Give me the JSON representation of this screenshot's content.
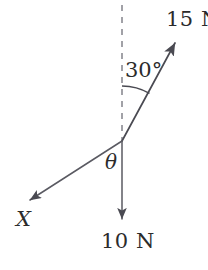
{
  "figure": {
    "type": "force-vector-diagram",
    "background_color": "#ffffff",
    "stroke_color": "#4a4a52",
    "text_color": "#2b2b2b"
  },
  "labels": {
    "force_up_right": "15 N",
    "angle_from_vertical": "30°",
    "angle_unknown": "θ",
    "force_down_left": "X",
    "force_down": "10 N"
  },
  "vectors": [
    {
      "name": "15N-vector",
      "label": "15 N",
      "magnitude": 15,
      "unit": "N",
      "origin": [
        122,
        141
      ],
      "tip": [
        177,
        40
      ],
      "direction": "up-right",
      "angle_from_vertical_deg": 30
    },
    {
      "name": "10N-vector",
      "label": "10 N",
      "magnitude": 10,
      "unit": "N",
      "origin": [
        122,
        141
      ],
      "tip": [
        122,
        224
      ],
      "direction": "down",
      "angle_from_vertical_deg": 180
    },
    {
      "name": "X-vector",
      "label": "X",
      "magnitude": null,
      "unit": "N",
      "origin": [
        122,
        141
      ],
      "tip": [
        25,
        203
      ],
      "direction": "down-left"
    }
  ],
  "reference_line": {
    "name": "vertical-dashed-reference",
    "from": [
      122,
      5
    ],
    "to": [
      122,
      141
    ],
    "style": "dashed"
  },
  "angles": [
    {
      "name": "angle-30-arc",
      "label": "30°",
      "value": 30,
      "between": [
        "vertical-dashed-reference",
        "15N-vector"
      ]
    },
    {
      "name": "angle-theta",
      "label": "θ",
      "value": null,
      "between": [
        "10N-vector",
        "X-vector"
      ]
    }
  ]
}
